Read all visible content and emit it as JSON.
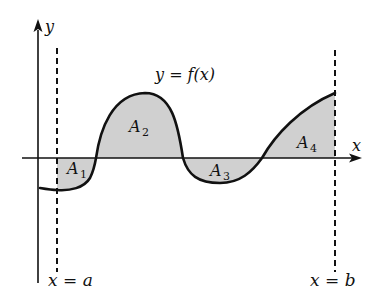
{
  "diagram": {
    "type": "area-under-curve",
    "function_label": "y = f(x)",
    "axes": {
      "x_label": "x",
      "y_label": "y"
    },
    "bounds": {
      "left_label": "x = a",
      "right_label": "x = b"
    },
    "regions": [
      {
        "name": "A",
        "sub": "1",
        "sign": "negative"
      },
      {
        "name": "A",
        "sub": "2",
        "sign": "positive"
      },
      {
        "name": "A",
        "sub": "3",
        "sign": "negative"
      },
      {
        "name": "A",
        "sub": "4",
        "sign": "positive"
      }
    ],
    "colors": {
      "curve": "#111111",
      "axis": "#111111",
      "shade": "#d0d0d0",
      "background": "#ffffff"
    }
  }
}
